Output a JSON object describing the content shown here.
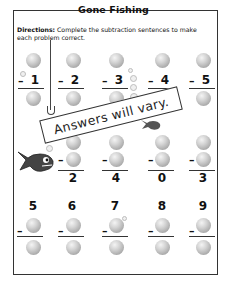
{
  "title": "Gone Fishing",
  "directions": {
    "label": "Directions:",
    "text": "Complete the subtraction sentences to make each problem correct."
  },
  "stamp": "Answers will vary.",
  "rows": [
    {
      "layout": "subtrahend-given",
      "problems": [
        {
          "minuend": "",
          "subtrahend": "1",
          "difference": ""
        },
        {
          "minuend": "",
          "subtrahend": "2",
          "difference": ""
        },
        {
          "minuend": "",
          "subtrahend": "3",
          "difference": ""
        },
        {
          "minuend": "",
          "subtrahend": "4",
          "difference": ""
        },
        {
          "minuend": "",
          "subtrahend": "5",
          "difference": ""
        }
      ]
    },
    {
      "layout": "difference-given",
      "problems": [
        {
          "minuend": "",
          "subtrahend": "",
          "difference": "2"
        },
        {
          "minuend": "",
          "subtrahend": "",
          "difference": "4"
        },
        {
          "minuend": "",
          "subtrahend": "",
          "difference": "0"
        },
        {
          "minuend": "",
          "subtrahend": "",
          "difference": "3"
        }
      ]
    },
    {
      "layout": "minuend-given",
      "problems": [
        {
          "minuend": "5",
          "subtrahend": "",
          "difference": ""
        },
        {
          "minuend": "6",
          "subtrahend": "",
          "difference": ""
        },
        {
          "minuend": "7",
          "subtrahend": "",
          "difference": ""
        },
        {
          "minuend": "8",
          "subtrahend": "",
          "difference": ""
        },
        {
          "minuend": "9",
          "subtrahend": "",
          "difference": ""
        }
      ]
    }
  ],
  "operator": "–",
  "icons": {
    "answer_bubble": "bubble-icon",
    "fish": "fish-icon",
    "fishing_line": "fishing-line-icon",
    "hook": "hook-icon"
  }
}
